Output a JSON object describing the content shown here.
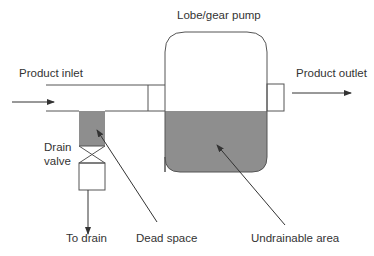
{
  "diagram": {
    "title": "Lobe/gear pump",
    "labels": {
      "pump": "Lobe/gear pump",
      "inlet": "Product inlet",
      "outlet": "Product outlet",
      "drain_valve_line1": "Drain",
      "drain_valve_line2": "valve",
      "to_drain": "To drain",
      "dead_space": "Dead space",
      "undrainable_area": "Undrainable area"
    },
    "colors": {
      "stroke": "#555555",
      "fill_shaded": "#8e8e8e",
      "text": "#333333",
      "background": "#ffffff"
    }
  }
}
